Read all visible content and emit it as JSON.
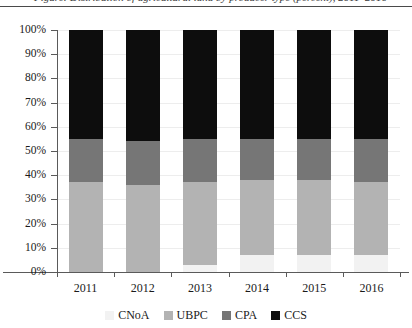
{
  "caption": {
    "text": "Figure: Distribution of agricultural land by producer type (percent), 2011–2016"
  },
  "chart_data": {
    "type": "bar",
    "variant": "stacked-100-percent",
    "title": "",
    "xlabel": "",
    "ylabel": "",
    "categories": [
      "2011",
      "2012",
      "2013",
      "2014",
      "2015",
      "2016"
    ],
    "ylim": [
      0,
      100
    ],
    "ytick_labels": [
      "0%",
      "10%",
      "20%",
      "30%",
      "40%",
      "50%",
      "60%",
      "70%",
      "80%",
      "90%",
      "100%"
    ],
    "ytick_values": [
      0,
      10,
      20,
      30,
      40,
      50,
      60,
      70,
      80,
      90,
      100
    ],
    "grid": true,
    "legend_position": "bottom",
    "stack_order_bottom_to_top": [
      "CNoA",
      "UBPC",
      "CPA",
      "CCS"
    ],
    "series": [
      {
        "name": "CNoA",
        "color": "#f2f2f2",
        "values": [
          0,
          0,
          3,
          7,
          7,
          7
        ]
      },
      {
        "name": "UBPC",
        "color": "#b3b3b3",
        "values": [
          37,
          36,
          34,
          31,
          31,
          30
        ]
      },
      {
        "name": "CPA",
        "color": "#767676",
        "values": [
          18,
          18,
          18,
          17,
          17,
          18
        ]
      },
      {
        "name": "CCS",
        "color": "#0d0d0d",
        "values": [
          45,
          46,
          45,
          45,
          45,
          45
        ]
      }
    ]
  },
  "legend": {
    "items": [
      {
        "label": "CNoA",
        "color": "#f2f2f2"
      },
      {
        "label": "UBPC",
        "color": "#b3b3b3"
      },
      {
        "label": "CPA",
        "color": "#767676"
      },
      {
        "label": "CCS",
        "color": "#0d0d0d"
      }
    ]
  },
  "colors": {
    "axis": "#5a5a5a",
    "gridline": "#ededed",
    "text": "#1a1a1a",
    "background": "#ffffff"
  }
}
